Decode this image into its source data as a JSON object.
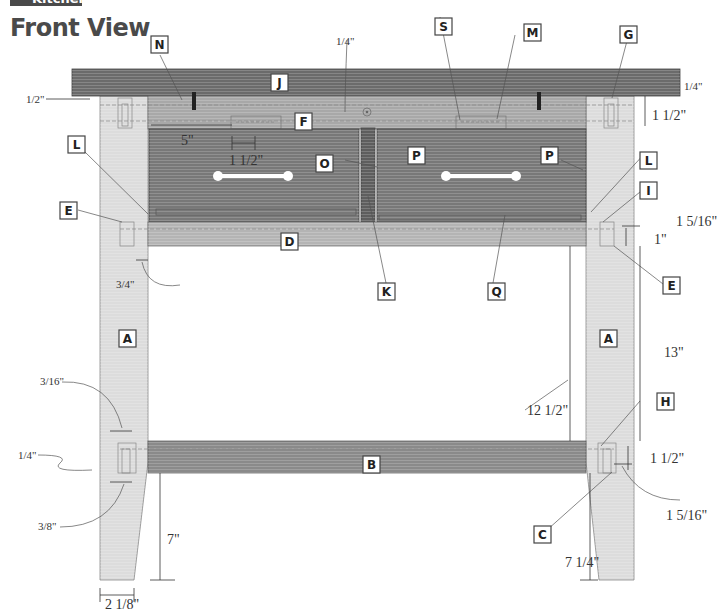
{
  "header": {
    "section": "Kitchen",
    "title": "Front View"
  },
  "colors": {
    "top": "#6b6b6b",
    "apron": "#a8a8a8",
    "leg": "#dcdcdc",
    "drawer": "#787878",
    "stretcher": "#8a8a8a",
    "rail": "#b4b4b4",
    "divider": "#5e5e5e"
  },
  "parts": {
    "A": "A",
    "B": "B",
    "C": "C",
    "D": "D",
    "E": "E",
    "F": "F",
    "G": "G",
    "H": "H",
    "I": "I",
    "J": "J",
    "K": "K",
    "L": "L",
    "M": "M",
    "N": "N",
    "O": "O",
    "P": "P",
    "Q": "Q",
    "S": "S"
  },
  "dimensions": {
    "top_overhang_left": "1/2\"",
    "apron_gap_top": "1/4\"",
    "right_top_gap": "1/4\"",
    "right_apron_height": "1 1/2\"",
    "pull_offset": "5\"",
    "slot_width": "1 1/2\"",
    "rail_setback": "3/4\"",
    "rail_tenon_length": "1 5/16\"",
    "rail_height": "1\"",
    "drawer_opening_height": "12 1/2\"",
    "leg_upper_section": "13\"",
    "mortise_width": "3/16\"",
    "left_peg_offset": "1/4\"",
    "peg_spacing": "3/8\"",
    "stretcher_height": "1 1/2\"",
    "stretcher_tenon_length": "1 5/16\"",
    "floor_to_stretcher_left": "7\"",
    "floor_to_stretcher_right": "7 1/4\"",
    "leg_foot_width": "2 1/8\""
  }
}
